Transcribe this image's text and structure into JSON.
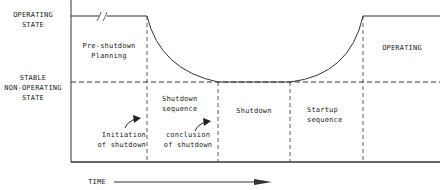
{
  "y_axis": {
    "operating_state": [
      "OPERATING",
      "STATE"
    ],
    "stable_state": [
      "STABLE",
      "NON-OPERATING",
      "STATE"
    ]
  },
  "phases": [
    {
      "label": [
        "Pre-shutdown",
        "Planning"
      ]
    },
    {
      "label": [
        "Shutdown",
        "sequence"
      ]
    },
    {
      "label": [
        "Shutdown"
      ]
    },
    {
      "label": [
        "Startup",
        "sequence"
      ]
    },
    {
      "label": [
        "OPERATING"
      ]
    }
  ],
  "annotations": {
    "initiation": [
      "Initiation",
      "of shutdown"
    ],
    "conclusion": [
      "conclusion",
      "of shutdown"
    ]
  },
  "x_axis": {
    "label": "TIME"
  },
  "colors": {
    "line": "#333333",
    "background": "#ffffff"
  }
}
